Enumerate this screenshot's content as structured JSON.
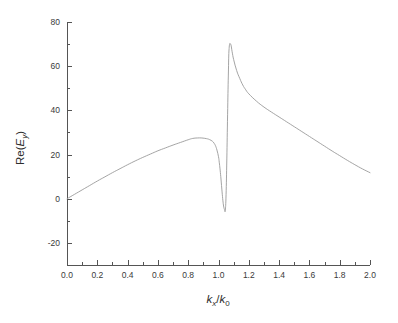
{
  "chart_data": {
    "type": "line",
    "title": "",
    "subtitle": "",
    "xlabel": "kx/k0",
    "xlabel_parts": {
      "main1": "k",
      "sub1": "x",
      "slash": "/",
      "main2": "k",
      "sub2": "0"
    },
    "ylabel": "Re(Ey)",
    "ylabel_parts": {
      "prefix": "Re(",
      "main": "E",
      "sub": "y",
      "suffix": ")"
    },
    "xlim": [
      0.0,
      2.0
    ],
    "ylim": [
      -30,
      80
    ],
    "xticks": [
      0.0,
      0.2,
      0.4,
      0.6,
      0.8,
      1.0,
      1.2,
      1.4,
      1.6,
      1.8,
      2.0
    ],
    "xticklabels": [
      "0.0",
      "0.2",
      "0.4",
      "0.6",
      "0.8",
      "1.0",
      "1.2",
      "1.4",
      "1.6",
      "1.8",
      "2.0"
    ],
    "yticks": [
      -20,
      0,
      20,
      40,
      60,
      80
    ],
    "yticklabels": [
      "-20",
      "0",
      "20",
      "40",
      "60",
      "80"
    ],
    "x_minor_interval": 0.1,
    "y_minor_interval": 10,
    "grid": false,
    "legend": false,
    "legend_position": "none",
    "line_color": "#9a9a9a",
    "axis_color": "#555555",
    "text_color": "#3a3a3a",
    "background_color": "#ffffff",
    "annotations": [],
    "series": [
      {
        "name": "Re(Ey)",
        "x": [
          0.0,
          0.05,
          0.1,
          0.15,
          0.2,
          0.25,
          0.3,
          0.35,
          0.4,
          0.45,
          0.5,
          0.55,
          0.6,
          0.65,
          0.7,
          0.75,
          0.8,
          0.83,
          0.86,
          0.89,
          0.92,
          0.94,
          0.96,
          0.97,
          0.98,
          0.99,
          1.0,
          1.005,
          1.01,
          1.015,
          1.02,
          1.025,
          1.03,
          1.035,
          1.04,
          1.045,
          1.05,
          1.055,
          1.06,
          1.065,
          1.07,
          1.08,
          1.09,
          1.1,
          1.12,
          1.14,
          1.16,
          1.18,
          1.2,
          1.25,
          1.3,
          1.35,
          1.4,
          1.45,
          1.5,
          1.55,
          1.6,
          1.65,
          1.7,
          1.75,
          1.8,
          1.85,
          1.9,
          1.95,
          2.0
        ],
        "y": [
          0.0,
          2.0,
          4.0,
          6.0,
          8.0,
          9.9,
          11.8,
          13.6,
          15.4,
          17.1,
          18.7,
          20.2,
          21.7,
          23.0,
          24.3,
          25.5,
          26.7,
          27.3,
          27.5,
          27.5,
          27.2,
          26.8,
          26.0,
          25.2,
          24.0,
          22.0,
          19.0,
          16.5,
          13.5,
          10.0,
          6.0,
          2.0,
          -1.5,
          -3.8,
          -5.0,
          -5.2,
          2.0,
          18.0,
          38.0,
          56.0,
          68.0,
          70.0,
          66.5,
          63.0,
          58.0,
          54.5,
          51.5,
          49.3,
          47.5,
          44.2,
          41.5,
          39.2,
          37.0,
          34.8,
          32.6,
          30.4,
          28.2,
          26.0,
          23.8,
          21.6,
          19.5,
          17.4,
          15.4,
          13.5,
          11.8
        ]
      }
    ],
    "key_points": {
      "start": {
        "x": 0.0,
        "y": 0.0
      },
      "broad_max": {
        "x": 0.86,
        "y": 27.5
      },
      "resonance_min": {
        "x": 1.045,
        "y": -5.2
      },
      "resonance_max": {
        "x": 1.08,
        "y": 70.0
      },
      "end": {
        "x": 2.0,
        "y": 11.8
      }
    }
  }
}
